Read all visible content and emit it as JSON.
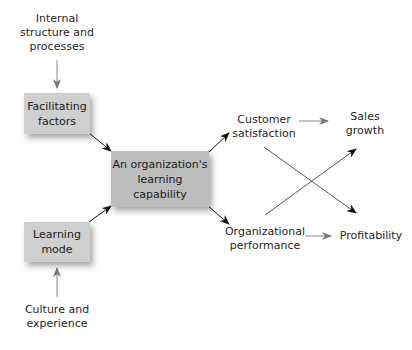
{
  "diagram": {
    "nodes": {
      "internal": {
        "label_line1": "Internal",
        "label_line2": "structure and",
        "label_line3": "processes"
      },
      "facilitating": {
        "label_line1": "Facilitating",
        "label_line2": "factors"
      },
      "capability": {
        "label_line1": "An organization's",
        "label_line2": "learning",
        "label_line3": "capability"
      },
      "learning_mode": {
        "label_line1": "Learning",
        "label_line2": "mode"
      },
      "culture": {
        "label_line1": "Culture and",
        "label_line2": "experience"
      },
      "customer": {
        "label_line1": "Customer",
        "label_line2": "satisfaction"
      },
      "org_perf": {
        "label_line1": "Organizational",
        "label_line2": "performance"
      },
      "sales": {
        "label_line1": "Sales",
        "label_line2": "growth"
      },
      "profitability": {
        "label_line1": "Profitability"
      }
    },
    "edges": [
      {
        "from": "Internal structure and processes",
        "to": "Facilitating factors"
      },
      {
        "from": "Culture and experience",
        "to": "Learning mode"
      },
      {
        "from": "Facilitating factors",
        "to": "An organization's learning capability"
      },
      {
        "from": "Learning mode",
        "to": "An organization's learning capability"
      },
      {
        "from": "An organization's learning capability",
        "to": "Customer satisfaction"
      },
      {
        "from": "An organization's learning capability",
        "to": "Organizational performance"
      },
      {
        "from": "Customer satisfaction",
        "to": "Sales growth"
      },
      {
        "from": "Customer satisfaction",
        "to": "Profitability"
      },
      {
        "from": "Organizational performance",
        "to": "Sales growth"
      },
      {
        "from": "Organizational performance",
        "to": "Profitability"
      }
    ],
    "colors": {
      "box_fill": "#cfcfcf",
      "center_box_fill": "#bdbdbd",
      "arrow_dark": "#111111",
      "arrow_gray": "#888888"
    }
  }
}
